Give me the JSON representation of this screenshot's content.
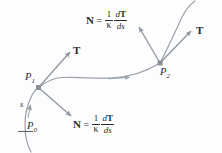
{
  "figure": {
    "background_color": "#fdfdfd",
    "curve_color": "#9aa3ad",
    "arrow_color": "#8e96a0",
    "text_color": "#2b2b2b"
  },
  "labels": {
    "point_p0": "P",
    "point_p0_sub": "0",
    "point_p1": "P",
    "point_p1_sub": "1",
    "point_p2": "P",
    "point_p2_sub": "2",
    "arc_length": "s",
    "tangent_left": "T",
    "tangent_right": "T"
  },
  "equations": {
    "normal_top": {
      "lhs": "N",
      "equals": "=",
      "coefficient_numerator": "1",
      "coefficient_denominator": "κ",
      "derivative_numerator_d": "d",
      "derivative_numerator_T": "T",
      "derivative_denominator": "ds"
    },
    "normal_bottom": {
      "lhs": "N",
      "equals": "=",
      "coefficient_numerator": "1",
      "coefficient_denominator": "κ",
      "derivative_numerator_d": "d",
      "derivative_numerator_T": "T",
      "derivative_denominator": "ds"
    }
  },
  "icons": {
    "curve": "space-curve-path",
    "direction_marker": "arrowhead-on-curve",
    "p0_tick": "tick-mark",
    "p1_dot": "point-marker",
    "p2_dot": "point-marker"
  }
}
